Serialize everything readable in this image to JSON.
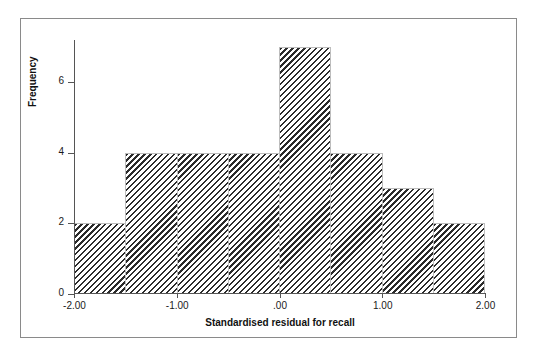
{
  "chart_data": {
    "type": "bar",
    "title": "",
    "subtitle": "",
    "xlabel": "Standardised residual for recall",
    "ylabel": "Frequency",
    "categories": [
      "-2.00 to -1.50",
      "-1.50 to -1.00",
      "-1.00 to -0.50",
      "-0.50 to .00",
      ".00 to .50",
      ".50 to 1.00",
      "1.00 to 1.50",
      "1.50 to 2.00"
    ],
    "bin_edges": [
      -2.0,
      -1.5,
      -1.0,
      -0.5,
      0.0,
      0.5,
      1.0,
      1.5,
      2.0
    ],
    "values": [
      2,
      4,
      4,
      4,
      7,
      4,
      3,
      2
    ],
    "xlim": [
      -2.0,
      2.0
    ],
    "ylim": [
      0,
      7.2
    ],
    "grid": false,
    "legend": false,
    "bar_fill": "diagonal-hatch",
    "bar_hatch_color": "#2b2b2b",
    "bar_edge_color": "#bdbdbd",
    "axis_color": "#555555",
    "frame_color": "#8a8a8a",
    "x_ticks": [
      {
        "value": -2.0,
        "label": "-2.00"
      },
      {
        "value": -1.0,
        "label": "-1.00"
      },
      {
        "value": 0.0,
        "label": ".00"
      },
      {
        "value": 1.0,
        "label": "1.00"
      },
      {
        "value": 2.0,
        "label": "2.00"
      }
    ],
    "y_ticks": [
      {
        "value": 0,
        "label": "0"
      },
      {
        "value": 2,
        "label": "2"
      },
      {
        "value": 4,
        "label": "4"
      },
      {
        "value": 6,
        "label": "6"
      }
    ]
  }
}
